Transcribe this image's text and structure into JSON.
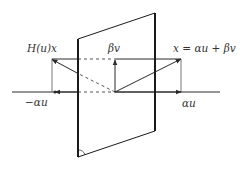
{
  "diagram": {
    "labels": {
      "reflected": "H(u)x",
      "beta_v": "βv",
      "x_eq": "x = αu + βv",
      "neg_alpha_u": "−αu",
      "alpha_u": "αu"
    },
    "colors": {
      "line": "#2a2a2a",
      "plane": "#1a1a1a",
      "text": "#333333"
    }
  }
}
